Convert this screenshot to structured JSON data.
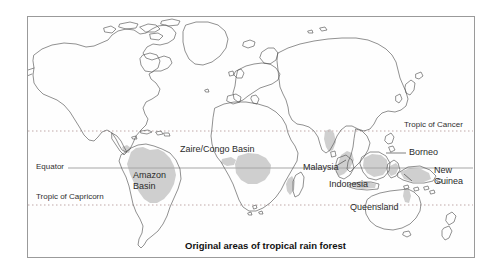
{
  "figure": {
    "caption": "Original areas of tropical rain forest",
    "frame": {
      "border_color": "#9a9a9a",
      "background": "#fefefe"
    }
  },
  "colors": {
    "coastline": "#4a4a4a",
    "forest_shading": "#cfcfcf",
    "forest_shading_light": "#dcdcdc",
    "equator_line": "#9d9d9d",
    "tropic_line": "#b8aaaa",
    "label_text": "#2b2b2b",
    "caption_text": "#111111",
    "page_background": "#ffffff"
  },
  "latitude_lines": [
    {
      "name": "tropic-of-cancer",
      "label": "Tropic of Cancer",
      "style": "dotted",
      "y": 131,
      "label_x": 404,
      "label_y": 120
    },
    {
      "name": "equator",
      "label": "Equator",
      "style": "solid",
      "y": 168,
      "label_x": 36,
      "label_y": 162
    },
    {
      "name": "tropic-of-capricorn",
      "label": "Tropic of Capricorn",
      "style": "dotted",
      "y": 205,
      "label_x": 36,
      "label_y": 192
    }
  ],
  "region_labels": [
    {
      "name": "amazon-basin",
      "text": "Amazon Basin",
      "line1": "Amazon",
      "line2": "Basin",
      "x": 133,
      "y": 170
    },
    {
      "name": "zaire-congo-basin",
      "text": "Zaire/Congo Basin",
      "x": 180,
      "y": 144
    },
    {
      "name": "malaysia",
      "text": "Malaysia",
      "x": 303,
      "y": 167
    },
    {
      "name": "indonesia",
      "text": "Indonesia",
      "x": 329,
      "y": 183
    },
    {
      "name": "borneo",
      "text": "Borneo",
      "x": 409,
      "y": 152
    },
    {
      "name": "new-guinea",
      "line1": "New",
      "line2": "Guinea",
      "text": "New Guinea",
      "x": 434,
      "y": 170
    },
    {
      "name": "queensland",
      "text": "Queensland",
      "x": 350,
      "y": 206
    }
  ],
  "legend": {
    "shaded_meaning": "Original areas of tropical rain forest"
  }
}
